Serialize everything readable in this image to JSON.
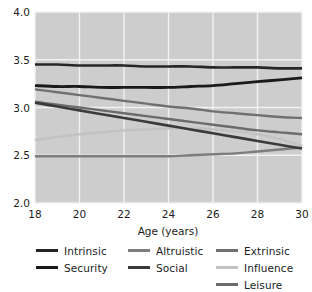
{
  "chart_data": {
    "type": "line",
    "title": "",
    "xlabel": "Age (years)",
    "ylabel": "",
    "xlim": [
      18,
      30
    ],
    "ylim": [
      2.0,
      4.0
    ],
    "xticks": [
      18,
      20,
      22,
      24,
      26,
      28,
      30
    ],
    "yticks": [
      "4.0",
      "3.5",
      "3.0",
      "2.5",
      "2.0"
    ],
    "xtick_labels": [
      "18",
      "20",
      "22",
      "24",
      "26",
      "28",
      "30"
    ],
    "grid": true,
    "grid_color": "#f2f2f2",
    "plot_background": "#cdcdcd",
    "figure_background": "#ffffff",
    "legend_position": "below-axes",
    "legend_columns": 3,
    "x": [
      18,
      19,
      20,
      21,
      22,
      23,
      24,
      25,
      26,
      27,
      28,
      29,
      30
    ],
    "series": [
      {
        "name": "Intrinsic",
        "color": "#262626",
        "width": 2.6,
        "values": [
          3.45,
          3.45,
          3.44,
          3.44,
          3.44,
          3.43,
          3.43,
          3.43,
          3.42,
          3.42,
          3.42,
          3.41,
          3.41
        ]
      },
      {
        "name": "Security",
        "color": "#1a1a1a",
        "width": 2.8,
        "values": [
          3.23,
          3.22,
          3.22,
          3.21,
          3.21,
          3.21,
          3.21,
          3.22,
          3.23,
          3.25,
          3.27,
          3.29,
          3.31
        ]
      },
      {
        "name": "Altruistic",
        "color": "#7d7d7d",
        "width": 2.4,
        "values": [
          2.49,
          2.49,
          2.49,
          2.49,
          2.49,
          2.49,
          2.49,
          2.5,
          2.51,
          2.52,
          2.54,
          2.56,
          2.58
        ]
      },
      {
        "name": "Social",
        "color": "#3a3a3a",
        "width": 2.6,
        "values": [
          3.05,
          3.01,
          2.97,
          2.93,
          2.89,
          2.85,
          2.81,
          2.77,
          2.73,
          2.69,
          2.65,
          2.61,
          2.57
        ]
      },
      {
        "name": "Extrinsic",
        "color": "#707070",
        "width": 2.4,
        "values": [
          3.19,
          3.16,
          3.13,
          3.1,
          3.07,
          3.04,
          3.01,
          2.99,
          2.96,
          2.94,
          2.92,
          2.9,
          2.89
        ]
      },
      {
        "name": "Influence",
        "color": "#c2c2c2",
        "width": 2.4,
        "values": [
          2.66,
          2.69,
          2.72,
          2.74,
          2.76,
          2.77,
          2.78,
          2.78,
          2.77,
          2.75,
          2.72,
          2.67,
          2.6
        ]
      },
      {
        "name": "Leisure",
        "color": "#6b6b6b",
        "width": 2.4,
        "values": [
          3.06,
          3.03,
          3.0,
          2.97,
          2.94,
          2.91,
          2.88,
          2.85,
          2.82,
          2.79,
          2.76,
          2.74,
          2.72
        ]
      }
    ]
  },
  "axes": {
    "x_label": "Age (years)",
    "x_ticks": [
      "18",
      "20",
      "22",
      "24",
      "26",
      "28",
      "30"
    ],
    "y_ticks": [
      "4.0",
      "3.5",
      "3.0",
      "2.5",
      "2.0"
    ]
  },
  "legend": {
    "columns": [
      {
        "entries": [
          {
            "label": "Intrinsic",
            "color": "#262626"
          },
          {
            "label": "Security",
            "color": "#1a1a1a"
          }
        ]
      },
      {
        "entries": [
          {
            "label": "Altruistic",
            "color": "#7d7d7d"
          },
          {
            "label": "Social",
            "color": "#3a3a3a"
          }
        ]
      },
      {
        "entries": [
          {
            "label": "Extrinsic",
            "color": "#707070"
          },
          {
            "label": "Influence",
            "color": "#c2c2c2"
          },
          {
            "label": "Leisure",
            "color": "#6b6b6b"
          }
        ]
      }
    ]
  }
}
